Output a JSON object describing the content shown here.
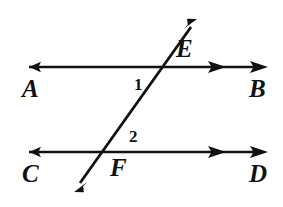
{
  "figure": {
    "background_color": "#ffffff",
    "stroke_color": "#111111",
    "width": 283,
    "height": 207
  },
  "lines": [
    {
      "id": "line-ab",
      "name": "upper-parallel-line",
      "label_left": "A",
      "label_right": "B",
      "y": 67,
      "x_start": 22,
      "x_end": 268,
      "arrow_left_count": 1,
      "arrow_right_count": 2
    },
    {
      "id": "line-cd",
      "name": "lower-parallel-line",
      "label_left": "C",
      "label_right": "D",
      "y": 152,
      "x_start": 22,
      "x_end": 268,
      "arrow_left_count": 1,
      "arrow_right_count": 2
    },
    {
      "id": "line-transversal",
      "name": "transversal-line",
      "x_start": 74,
      "y_start": 192,
      "x_end": 197,
      "y_end": 19,
      "arrow_start_count": 1,
      "arrow_end_count": 1
    }
  ],
  "labels": {
    "point_a": "A",
    "point_b": "B",
    "point_c": "C",
    "point_d": "D",
    "point_e": "E",
    "point_f": "F",
    "angle_1": "1",
    "angle_2": "2"
  },
  "intersections": [
    {
      "name": "intersection-e",
      "label": "E",
      "x": 165,
      "y": 67
    },
    {
      "name": "intersection-f",
      "label": "F",
      "x": 105,
      "y": 152
    }
  ],
  "angles": [
    {
      "name": "angle-1",
      "label": "1",
      "x": 138,
      "y": 84,
      "location": "below-upper-line-left-of-transversal"
    },
    {
      "name": "angle-2",
      "label": "2",
      "x": 133,
      "y": 136,
      "location": "above-lower-line-right-of-transversal"
    }
  ]
}
